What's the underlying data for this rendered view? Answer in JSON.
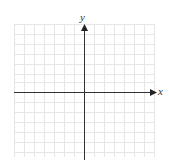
{
  "header": {
    "text": ""
  },
  "graph": {
    "x_label": "x",
    "y_label": "y",
    "grid": {
      "columns": 14,
      "rows": 13,
      "cell_px": 10
    },
    "colors": {
      "grid": "#e6e6e6",
      "axis": "#333333",
      "background": "#ffffff"
    }
  }
}
